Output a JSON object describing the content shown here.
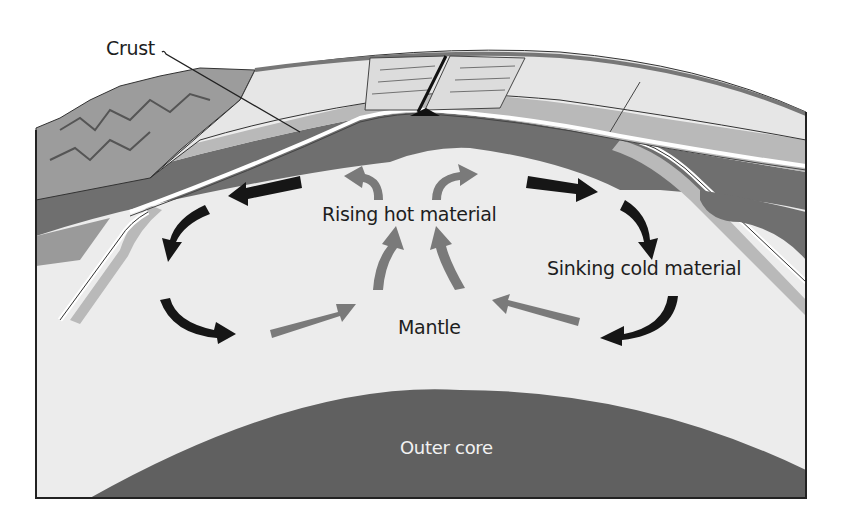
{
  "figure": {
    "type": "cross-section diagram"
  },
  "labels": {
    "crust": "Crust",
    "rising": "Rising hot material",
    "sinking": "Sinking cold material",
    "mantle": "Mantle",
    "outer_core": "Outer core"
  },
  "arrows": {
    "hot_color": "#7a7a7a",
    "cold_color": "#161616",
    "hot_count": 6,
    "cold_count": 6
  },
  "colors": {
    "background": "#ffffff",
    "mantle": "#ececec",
    "crust_surface": "#e6e6e6",
    "lithosphere_dark": "#6f6f6f",
    "lithosphere_light": "#b9b9b9",
    "outer_core": "#606060",
    "frame": "#222222"
  }
}
